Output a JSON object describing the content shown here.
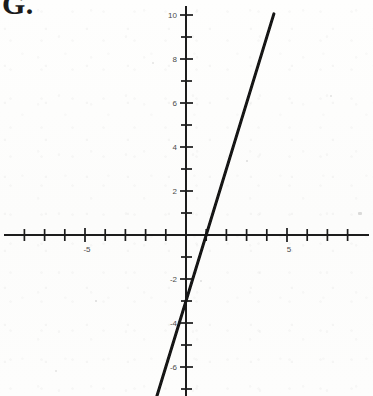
{
  "figure": {
    "corner_label": "G.",
    "background_color": "#fdfdfc",
    "ink_color": "#1b1b1b",
    "tick_label_color": "#4a4a4a"
  },
  "chart_data": {
    "type": "line",
    "title": "G.",
    "xlabel": "",
    "ylabel": "",
    "xlim": [
      -8.5,
      8.5
    ],
    "ylim": [
      -7.5,
      10.5
    ],
    "grid": false,
    "legend_position": "none",
    "axes": {
      "x_axis_label_values": [
        "-5",
        "5"
      ],
      "x_axis_label_positions": [
        -5,
        5
      ],
      "y_axis_label_values": [
        "10",
        "8",
        "6",
        "4",
        "2",
        "-2",
        "-4",
        "-6"
      ],
      "y_axis_label_positions": [
        10,
        8,
        6,
        4,
        2,
        -2,
        -4,
        -6
      ],
      "x_tick_values": [
        -8,
        -7,
        -6,
        -5,
        -4,
        -3,
        -2,
        -1,
        1,
        2,
        3,
        4,
        5,
        6,
        7,
        8
      ],
      "y_tick_values": [
        10,
        9,
        8,
        7,
        6,
        5,
        4,
        3,
        2,
        1,
        -1,
        -2,
        -3,
        -4,
        -5,
        -6,
        -7
      ],
      "x_tick_interval": 1,
      "y_tick_interval": 1
    },
    "series": [
      {
        "name": "line",
        "equation": "y = 3x - 3",
        "slope": 3,
        "y_intercept": -3,
        "x_intercept": 1,
        "x": [
          -1.45,
          4.35
        ],
        "values": [
          -7.35,
          10.05
        ],
        "color": "#121212",
        "line_width": 3
      }
    ]
  }
}
